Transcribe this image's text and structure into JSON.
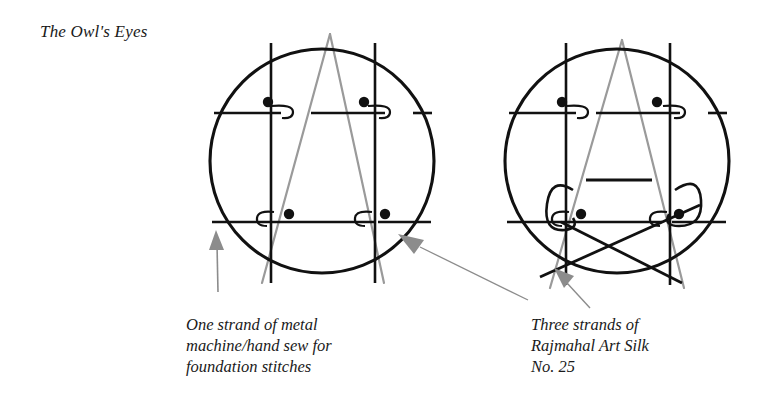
{
  "page": {
    "title": "The Owl's Eyes",
    "background_color": "#ffffff"
  },
  "colors": {
    "ink": "#111111",
    "thread_gray": "#9a9a9a",
    "arrow_gray": "#8c8c8c",
    "text": "#1a1a1a"
  },
  "captions": {
    "left": {
      "line1": "One strand of metal",
      "line2": "machine/hand sew for",
      "line3": "foundation stitches"
    },
    "right": {
      "line1": "Three strands of",
      "line2": "Rajmahal Art Silk",
      "line3": "No. 25"
    }
  },
  "diagrams": [
    {
      "name": "owl-eyes-foundation-diagram",
      "label": "left",
      "circle": {
        "cx": 322,
        "cy": 161,
        "r": 112
      },
      "vertical_lines_x": [
        271,
        375
      ],
      "horizontal_rows_y": [
        113,
        222
      ],
      "dots": [
        {
          "x": 268,
          "y": 102
        },
        {
          "x": 364,
          "y": 102
        },
        {
          "x": 289,
          "y": 214
        },
        {
          "x": 385,
          "y": 214
        }
      ],
      "thread_shape": "A-triangle",
      "stitch_loops": 4
    },
    {
      "name": "owl-eyes-silk-diagram",
      "label": "right",
      "circle": {
        "cx": 617,
        "cy": 161,
        "r": 112
      },
      "vertical_lines_x": [
        566,
        670
      ],
      "horizontal_rows_y": [
        113,
        222
      ],
      "dots": [
        {
          "x": 562,
          "y": 102
        },
        {
          "x": 657,
          "y": 102
        },
        {
          "x": 581,
          "y": 214
        },
        {
          "x": 679,
          "y": 214
        }
      ],
      "beak_line": {
        "x1": 586,
        "x2": 652,
        "y": 180
      },
      "thread_shape": "A-triangle",
      "crossing_diagonals": 2,
      "hook_curves": 2
    }
  ],
  "arrows": [
    {
      "name": "arrow-to-left-diagram",
      "from": [
        218,
        290
      ],
      "to": [
        216,
        232
      ],
      "color": "#8c8c8c"
    },
    {
      "name": "arrow-to-left-diagram-right-edge",
      "from": [
        530,
        300
      ],
      "to": [
        400,
        234
      ],
      "color": "#8c8c8c"
    },
    {
      "name": "arrow-to-right-diagram",
      "from": [
        586,
        306
      ],
      "to": [
        556,
        268
      ],
      "color": "#8c8c8c"
    }
  ]
}
